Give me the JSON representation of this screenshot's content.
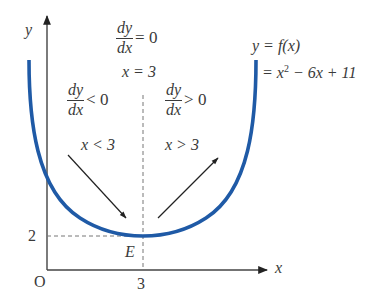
{
  "figure": {
    "axes": {
      "x_label": "x",
      "y_label": "y",
      "origin_label": "O",
      "x_tick": "3",
      "y_tick": "2"
    },
    "curve": {
      "color": "#1f5aa6",
      "label_line1": "y = f(x)",
      "label_line2_prefix": "= x",
      "label_line2_exp": "2",
      "label_line2_suffix": " − 6x + 11"
    },
    "vertex": {
      "label": "E",
      "x": 3,
      "y": 2
    },
    "top_annotation": {
      "num": "dy",
      "den": "dx",
      "relation": "= 0",
      "condition": "x = 3"
    },
    "left_annotation": {
      "num": "dy",
      "den": "dx",
      "relation": "< 0",
      "condition": "x < 3"
    },
    "right_annotation": {
      "num": "dy",
      "den": "dx",
      "relation": "> 0",
      "condition": "x > 3"
    }
  }
}
